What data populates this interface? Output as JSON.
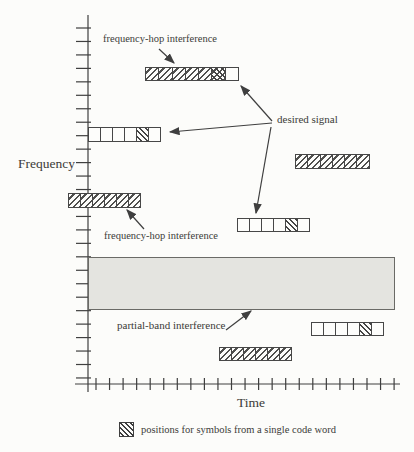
{
  "figure": {
    "axis": {
      "frequency_label": "Frequency",
      "time_label": "Time",
      "y_ticks": {
        "count": 27,
        "start": 28,
        "step": 13.46,
        "x1": 76,
        "x2": 91
      },
      "x_ticks": {
        "count": 23,
        "start": 96,
        "step": 13.55,
        "y1": 378,
        "y2": 390
      },
      "y_axis": {
        "x": 88,
        "top": 15,
        "bottom": 392
      },
      "x_axis": {
        "y": 384,
        "left": 75,
        "right": 400
      }
    },
    "annotations": {
      "fh_top": "frequency-hop interference",
      "fh_left": "frequency-hop interference",
      "desired": "desired signal",
      "partial": "partial-band interference"
    },
    "legend": {
      "swatch_icon": "back-hatch-square",
      "text": "positions for symbols from a single code word"
    },
    "colors": {
      "ink": "#3f3f3f",
      "hatch": "#4f4f4e",
      "band_fill": "#e4e4e0",
      "paper": "#fcfcfa"
    },
    "band": {
      "name": "partial-band-interference-region",
      "x": 88,
      "y": 257,
      "w": 307,
      "h": 53
    },
    "bars": [
      {
        "name": "frequency-hop-interference-bar-top",
        "x": 145,
        "y": 67,
        "h": 14,
        "cell_w": 14.3,
        "cells": [
          "fwd",
          "fwd",
          "fwd",
          "fwd",
          "fwd",
          "cross",
          "empty"
        ]
      },
      {
        "name": "desired-signal-bar-upper-left",
        "x": 88,
        "y": 127,
        "h": 15,
        "cell_w": 13,
        "cells": [
          "empty",
          "empty",
          "empty",
          "empty",
          "back",
          "empty"
        ]
      },
      {
        "name": "frequency-hop-interference-bar-right",
        "x": 295,
        "y": 154,
        "h": 15,
        "cell_w": 13.3,
        "cells": [
          "fwd",
          "fwd",
          "fwd",
          "fwd",
          "fwd",
          "fwd"
        ]
      },
      {
        "name": "frequency-hop-interference-bar-on-axis",
        "x": 68,
        "y": 193,
        "h": 15,
        "cell_w": 13,
        "cells": [
          "fwd",
          "fwd",
          "fwd",
          "fwd",
          "fwd",
          "fwd"
        ]
      },
      {
        "name": "desired-signal-bar-middle",
        "x": 237,
        "y": 218,
        "h": 14,
        "cell_w": 13,
        "cells": [
          "empty",
          "empty",
          "empty",
          "empty",
          "back",
          "empty"
        ]
      },
      {
        "name": "desired-signal-bar-lower-right",
        "x": 311,
        "y": 322,
        "h": 14,
        "cell_w": 13,
        "cells": [
          "empty",
          "empty",
          "empty",
          "empty",
          "back",
          "empty"
        ]
      },
      {
        "name": "frequency-hop-interference-bar-bottom",
        "x": 219,
        "y": 347,
        "h": 14,
        "cell_w": 13,
        "cells": [
          "fwd",
          "fwd",
          "fwd",
          "fwd",
          "fwd",
          "fwd"
        ]
      }
    ],
    "arrows": [
      {
        "name": "arrow-fh-top-label-to-bar",
        "x1": 159,
        "y1": 49,
        "x2": 174,
        "y2": 63
      },
      {
        "name": "arrow-desired-signal-to-top-bar",
        "x1": 272,
        "y1": 121,
        "x2": 241,
        "y2": 86
      },
      {
        "name": "arrow-desired-signal-to-left-bar",
        "x1": 272,
        "y1": 123,
        "x2": 170,
        "y2": 132
      },
      {
        "name": "arrow-desired-signal-to-middle-bar",
        "x1": 271,
        "y1": 127,
        "x2": 256,
        "y2": 213
      },
      {
        "name": "arrow-fh-left-label-to-bar",
        "x1": 144,
        "y1": 229,
        "x2": 127,
        "y2": 210
      },
      {
        "name": "arrow-partial-band-label-to-band",
        "x1": 226,
        "y1": 330,
        "x2": 251,
        "y2": 311
      }
    ]
  }
}
